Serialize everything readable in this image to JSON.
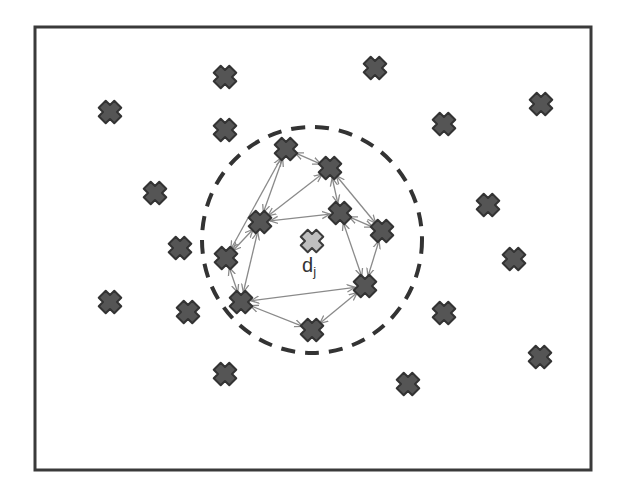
{
  "diagram": {
    "frame": {
      "x": 35,
      "y": 27,
      "width": 556,
      "height": 443,
      "stroke": "#3a3a3a",
      "stroke_width": 3
    },
    "neighborhood_circle": {
      "cx": 312,
      "cy": 240,
      "rx": 110,
      "ry": 113,
      "stroke": "#333333",
      "stroke_width": 4,
      "dash": "14,10"
    },
    "center_node": {
      "id": "dj",
      "x": 312,
      "y": 241,
      "fill": "#bfbfbf",
      "stroke": "#3c3c3c"
    },
    "center_label": {
      "main": "d",
      "subscript": "j",
      "x": 302,
      "y": 255
    },
    "node_style": {
      "fill": "#555555",
      "stroke": "#333333",
      "size": 11
    },
    "edge_style": {
      "stroke": "#8a8a8a",
      "stroke_width": 1.3
    },
    "inner_nodes": [
      {
        "id": "A",
        "x": 286,
        "y": 149
      },
      {
        "id": "B",
        "x": 330,
        "y": 168
      },
      {
        "id": "C",
        "x": 260,
        "y": 222
      },
      {
        "id": "D",
        "x": 340,
        "y": 213
      },
      {
        "id": "E",
        "x": 382,
        "y": 231
      },
      {
        "id": "F",
        "x": 226,
        "y": 258
      },
      {
        "id": "G",
        "x": 241,
        "y": 302
      },
      {
        "id": "H",
        "x": 365,
        "y": 286
      },
      {
        "id": "I",
        "x": 312,
        "y": 330
      }
    ],
    "outer_nodes": [
      {
        "x": 110,
        "y": 112
      },
      {
        "x": 225,
        "y": 77
      },
      {
        "x": 375,
        "y": 68
      },
      {
        "x": 225,
        "y": 130
      },
      {
        "x": 541,
        "y": 104
      },
      {
        "x": 444,
        "y": 124
      },
      {
        "x": 155,
        "y": 193
      },
      {
        "x": 488,
        "y": 205
      },
      {
        "x": 180,
        "y": 248
      },
      {
        "x": 514,
        "y": 259
      },
      {
        "x": 110,
        "y": 302
      },
      {
        "x": 188,
        "y": 312
      },
      {
        "x": 444,
        "y": 313
      },
      {
        "x": 540,
        "y": 357
      },
      {
        "x": 225,
        "y": 374
      },
      {
        "x": 408,
        "y": 384
      }
    ],
    "edges": [
      [
        "A",
        "B"
      ],
      [
        "A",
        "C"
      ],
      [
        "A",
        "F"
      ],
      [
        "B",
        "C"
      ],
      [
        "B",
        "D"
      ],
      [
        "B",
        "E"
      ],
      [
        "C",
        "D"
      ],
      [
        "C",
        "F"
      ],
      [
        "C",
        "G"
      ],
      [
        "D",
        "E"
      ],
      [
        "D",
        "H"
      ],
      [
        "E",
        "H"
      ],
      [
        "F",
        "G"
      ],
      [
        "G",
        "H"
      ],
      [
        "G",
        "I"
      ],
      [
        "H",
        "I"
      ]
    ]
  }
}
